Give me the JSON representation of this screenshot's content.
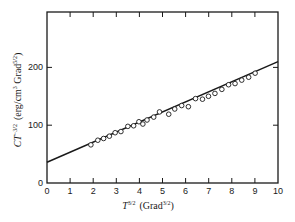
{
  "chart_data": {
    "type": "scatter",
    "title": "",
    "xlabel": "T^{3/2} (Grad^{3/2})",
    "ylabel": "CT^{-3/2} (erg/cm^3 Grad^{5/2})",
    "xlabel_parts": {
      "main": "T",
      "main_sup": "3/2",
      "unit": "(Grad",
      "unit_sup": "3/2",
      "close": ")"
    },
    "ylabel_parts": {
      "main": "CT",
      "main_sup": "−3/2",
      "unit": "(erg/cm",
      "unit_sup1": "3",
      "unit2": " Grad",
      "unit_sup2": "5/2",
      "close": ")"
    },
    "xlim": [
      0,
      10
    ],
    "ylim": [
      0,
      290
    ],
    "x_ticks": [
      0,
      1,
      2,
      3,
      4,
      5,
      6,
      7,
      8,
      9,
      10
    ],
    "y_ticks": [
      0,
      100,
      200
    ],
    "grid": false,
    "legend": null,
    "series": [
      {
        "name": "measured",
        "marker": "open-circle",
        "x": [
          1.9,
          2.2,
          2.45,
          2.7,
          2.95,
          3.2,
          3.5,
          3.75,
          3.98,
          4.15,
          4.33,
          4.62,
          4.87,
          5.27,
          5.53,
          5.83,
          6.12,
          6.43,
          6.73,
          6.99,
          7.27,
          7.57,
          7.86,
          8.14,
          8.43,
          8.73,
          9.01
        ],
        "y": [
          66,
          74,
          77,
          81,
          87,
          89,
          98,
          99,
          106,
          102,
          109,
          114,
          123,
          119,
          128,
          134,
          132,
          146,
          145,
          150,
          155,
          162,
          170,
          172,
          178,
          183,
          190
        ]
      },
      {
        "name": "linear fit",
        "marker": "line",
        "x": [
          0,
          10
        ],
        "y": [
          36,
          210
        ]
      }
    ]
  }
}
